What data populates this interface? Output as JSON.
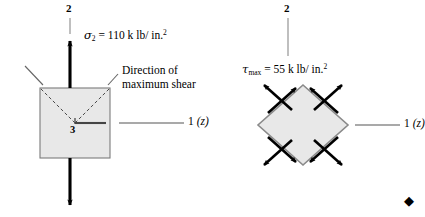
{
  "figure": {
    "background_color": "#ffffff",
    "ink_color": "#000000",
    "block_fill_color": "#e8e8e8",
    "block_stroke_color": "#7a7a7a",
    "dashed_color": "#4a4a4a",
    "end_marker": "◆",
    "left_panel": {
      "name": "principal-stress-element",
      "vertical_axis_label": "2",
      "horizontal_axis_label": "1",
      "horizontal_axis_paren": "(z)",
      "out_of_plane_label": "3",
      "stress_symbol": "σ",
      "stress_subscript": "2",
      "stress_equals": "=",
      "stress_value": "110",
      "stress_units": "k lb/ in.",
      "stress_units_exponent": "2",
      "annotation_line1": "Direction of",
      "annotation_line2": "maximum shear"
    },
    "right_panel": {
      "name": "maximum-shear-element",
      "vertical_axis_label": "2",
      "horizontal_axis_label": "1",
      "horizontal_axis_paren": "(z)",
      "stress_symbol": "τ",
      "stress_subscript": "max",
      "stress_equals": "=",
      "stress_value": "55",
      "stress_units": "k lb/ in.",
      "stress_units_exponent": "2"
    }
  }
}
